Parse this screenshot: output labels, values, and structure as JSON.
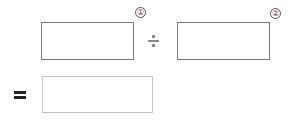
{
  "equation": {
    "operand1": {
      "marker": "①",
      "value": ""
    },
    "operator": "÷",
    "operand2": {
      "marker": "②",
      "value": ""
    },
    "equals": "=",
    "result": {
      "value": ""
    }
  }
}
